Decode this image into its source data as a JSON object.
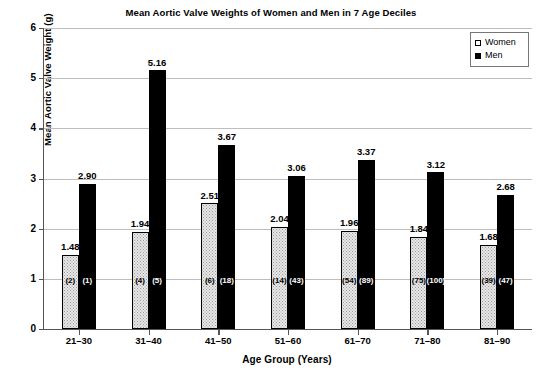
{
  "chart_data": {
    "type": "bar",
    "title": "Mean Aortic Valve Weights of Women and Men in 7 Age Deciles",
    "xlabel": "Age Group (Years)",
    "ylabel": "Mean Aortic Valve Weight (g)",
    "ylim": [
      0,
      6
    ],
    "ytick_labels": [
      "6",
      "5",
      "4",
      "3",
      "2",
      "1",
      "0"
    ],
    "ytick_values": [
      6,
      5,
      4,
      3,
      2,
      1,
      0
    ],
    "grid": "horizontal",
    "legend_position": "top-right",
    "categories": [
      "21–30",
      "31–40",
      "41–50",
      "51–60",
      "61–70",
      "71–80",
      "81–90"
    ],
    "series": [
      {
        "name": "Women",
        "color": "#e8e8e8",
        "values": [
          1.48,
          1.94,
          2.51,
          2.04,
          1.96,
          1.84,
          1.68
        ],
        "value_labels": [
          "1.48",
          "1.94",
          "2.51",
          "2.04",
          "1.96",
          "1.84",
          "1.68"
        ],
        "counts": [
          2,
          4,
          6,
          14,
          54,
          75,
          39
        ],
        "count_labels": [
          "(2)",
          "(4)",
          "(6)",
          "(14)",
          "(54)",
          "(75)",
          "(39)"
        ]
      },
      {
        "name": "Men",
        "color": "#000000",
        "values": [
          2.9,
          5.16,
          3.67,
          3.06,
          3.37,
          3.12,
          2.68
        ],
        "value_labels": [
          "2.90",
          "5.16",
          "3.67",
          "3.06",
          "3.37",
          "3.12",
          "2.68"
        ],
        "counts": [
          1,
          5,
          18,
          43,
          89,
          100,
          47
        ],
        "count_labels": [
          "(1)",
          "(5)",
          "(18)",
          "(43)",
          "(89)",
          "(100)",
          "(47)"
        ]
      }
    ]
  },
  "legend": {
    "women_label": "Women",
    "men_label": "Men"
  }
}
